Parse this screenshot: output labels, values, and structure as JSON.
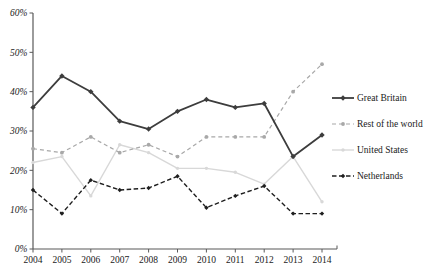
{
  "chart_data": {
    "type": "line",
    "title": "",
    "xlabel": "",
    "ylabel": "",
    "x_labels": [
      "2004",
      "2005",
      "2006",
      "2007",
      "2008",
      "2009",
      "2010",
      "2011",
      "2012",
      "2013",
      "2014"
    ],
    "y_tick_labels": [
      "0%",
      "10%",
      "20%",
      "30%",
      "40%",
      "50%",
      "60%"
    ],
    "ylim": [
      0,
      60
    ],
    "grid": false,
    "legend_position": "right",
    "axis_color": "#595959",
    "text_color": "#1a1a1a",
    "series": [
      {
        "name": "Great Britain",
        "color": "#3d3d3d",
        "style": "solid",
        "marker": "diamond",
        "values": [
          36,
          44,
          40,
          32.5,
          30.5,
          35,
          38,
          36,
          37,
          23.5,
          29
        ]
      },
      {
        "name": "Rest of the world",
        "color": "#a8a8a8",
        "style": "dashed",
        "marker": "circle",
        "values": [
          25.5,
          24.5,
          28.5,
          24.5,
          26.5,
          23.5,
          28.5,
          28.5,
          28.5,
          40,
          47
        ]
      },
      {
        "name": "United States",
        "color": "#d8d8d8",
        "style": "solid",
        "marker": "circle",
        "values": [
          22,
          23.5,
          13.5,
          26.5,
          24.5,
          20.5,
          20.5,
          19.5,
          16.5,
          23.5,
          12
        ]
      },
      {
        "name": "Netherlands",
        "color": "#1f1f1f",
        "style": "dashed",
        "marker": "diamond",
        "values": [
          15,
          9,
          17.5,
          15,
          15.5,
          18.5,
          10.5,
          13.5,
          16,
          9,
          9
        ]
      }
    ]
  }
}
